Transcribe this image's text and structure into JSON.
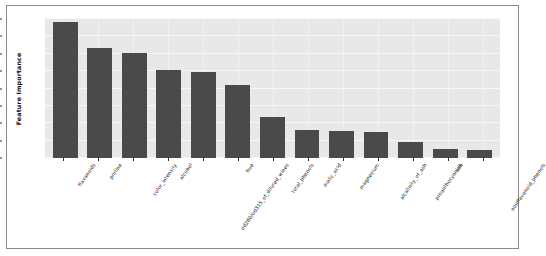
{
  "figure": {
    "frame_color": "#8a8a8a",
    "background": "#ffffff"
  },
  "chart_data": {
    "type": "bar",
    "title": "",
    "xlabel": "",
    "ylabel": "Feature Importance",
    "ylim": [
      0.0,
      0.2
    ],
    "grid": true,
    "legend": null,
    "axes_facecolor": "#e8e8e8",
    "bar_color": "#4a4a4a",
    "grid_color": "#f7f7f7",
    "ytick_labels": [
      "0.000",
      "0.025",
      "0.050",
      "0.075",
      "0.100",
      "0.125",
      "0.150",
      "0.175",
      "0.200"
    ],
    "ytick_values": [
      0.0,
      0.025,
      0.05,
      0.075,
      0.1,
      0.125,
      0.15,
      0.175,
      0.2
    ],
    "categories": [
      "flavanoids",
      "proline",
      "color_intensity",
      "alcohol",
      "od280/od315_of_diluted_wines",
      "hue",
      "total_phenols",
      "malic_acid",
      "magnesium",
      "alcalinity_of_ash",
      "proanthocyanins",
      "ash",
      "nonflavanoid_phenols"
    ],
    "values": [
      0.196,
      0.158,
      0.151,
      0.127,
      0.124,
      0.105,
      0.059,
      0.04,
      0.039,
      0.038,
      0.023,
      0.013,
      0.012
    ]
  }
}
